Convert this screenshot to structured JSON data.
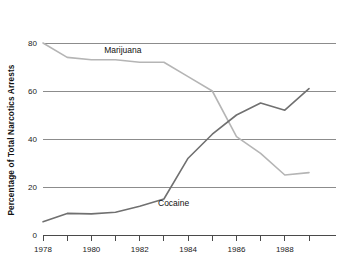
{
  "chart_data": {
    "type": "line",
    "title": "",
    "subtitle": "",
    "xlabel": "",
    "ylabel": "Percentage of Total Narcotics Arrests",
    "xlim": [
      1978,
      1989
    ],
    "ylim": [
      0,
      80
    ],
    "grid": true,
    "gridlines_y": [
      20,
      40,
      60,
      80
    ],
    "legend_position": "inline-annotation",
    "y_ticks": [
      0,
      20,
      40,
      60,
      80
    ],
    "y_tick_labels": [
      "0",
      "20",
      "40",
      "60",
      "80"
    ],
    "x_ticks": [
      1978,
      1979,
      1980,
      1981,
      1982,
      1983,
      1984,
      1985,
      1986,
      1987,
      1988,
      1989
    ],
    "x_tick_labels": [
      "1978",
      "",
      "1980",
      "",
      "1982",
      "",
      "1984",
      "",
      "1986",
      "",
      "1988",
      ""
    ],
    "x": [
      1978,
      1979,
      1980,
      1981,
      1982,
      1983,
      1984,
      1985,
      1986,
      1987,
      1988,
      1989
    ],
    "series": [
      {
        "name": "Marijuana",
        "color": "#b5b5b5",
        "values": [
          80,
          74,
          73,
          73,
          72,
          72,
          66,
          60,
          41,
          34,
          25,
          26
        ],
        "annotation": {
          "text": "Marijuana",
          "x": 1981.3,
          "y": 76
        }
      },
      {
        "name": "Cocaine",
        "color": "#707070",
        "values": [
          5.5,
          9,
          8.8,
          9.5,
          12,
          15,
          32,
          42,
          50,
          55,
          52,
          61
        ],
        "annotation": {
          "text": "Cocaine",
          "x": 1983.4,
          "y": 12
        }
      }
    ]
  },
  "axes": {
    "y_label": "Percentage of Total Narcotics Arrests",
    "y_tick_0": "0",
    "y_tick_20": "20",
    "y_tick_40": "40",
    "y_tick_60": "60",
    "y_tick_80": "80",
    "x_tick_1978": "1978",
    "x_tick_1980": "1980",
    "x_tick_1982": "1982",
    "x_tick_1984": "1984",
    "x_tick_1986": "1986",
    "x_tick_1988": "1988"
  },
  "annotations": {
    "marijuana_label": "Marijuana",
    "cocaine_label": "Cocaine"
  },
  "colors": {
    "marijuana_line": "#b5b5b5",
    "cocaine_line": "#707070",
    "gridline": "#8c8c8c",
    "axis": "#4a4a4a",
    "background": "#ffffff",
    "text": "#111111"
  }
}
